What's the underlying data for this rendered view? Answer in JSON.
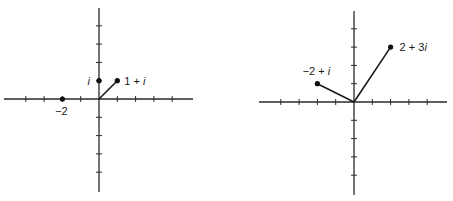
{
  "figures": [
    {
      "name": "left-plane",
      "origin": [
        99,
        99
      ],
      "unit": 18.3,
      "x_axis": [
        4,
        193
      ],
      "y_axis": [
        8,
        192
      ],
      "ticks": [
        -4,
        -3,
        -2,
        -1,
        1,
        2,
        3,
        4
      ],
      "points": [
        {
          "id": "point-i",
          "re": 0,
          "im": 1,
          "label_pre": "",
          "label_it": "i",
          "label_post": "",
          "lx": -9,
          "ly": 4,
          "anchor": "end",
          "vector": false
        },
        {
          "id": "point-1-plus-i",
          "re": 1,
          "im": 1,
          "label_pre": "1 + ",
          "label_it": "i",
          "label_post": "",
          "lx": 7,
          "ly": 4,
          "anchor": "start",
          "vector": true
        },
        {
          "id": "point-minus-2",
          "re": -2,
          "im": 0,
          "label_pre": "−2",
          "label_it": "",
          "label_post": "",
          "lx": -1,
          "ly": 16,
          "anchor": "middle",
          "vector": false
        }
      ]
    },
    {
      "name": "right-plane",
      "origin": [
        354,
        102
      ],
      "unit": 18.3,
      "x_axis": [
        259,
        447
      ],
      "y_axis": [
        11,
        195
      ],
      "ticks": [
        -4,
        -3,
        -2,
        -1,
        1,
        2,
        3,
        4
      ],
      "points": [
        {
          "id": "point-2-plus-3i",
          "re": 2,
          "im": 3,
          "label_pre": "2 + 3",
          "label_it": "i",
          "label_post": "",
          "lx": 9,
          "ly": 4,
          "anchor": "start",
          "vector": true
        },
        {
          "id": "point-minus-2-plus-i",
          "re": -2,
          "im": 1,
          "label_pre": "−2 + ",
          "label_it": "i",
          "label_post": "",
          "lx": -1,
          "ly": -9,
          "anchor": "middle",
          "vector": true
        }
      ]
    }
  ]
}
